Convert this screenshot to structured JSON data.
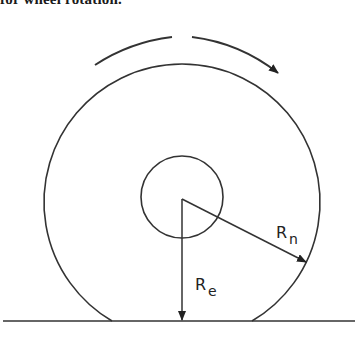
{
  "caption": {
    "text": "for wheel rotation."
  },
  "diagram": {
    "type": "tire-radius-schematic",
    "elements": {
      "outer_tire": {
        "cx": 183,
        "cy": 197,
        "r": 138,
        "flat_contact_left_x": 112,
        "flat_contact_right_x": 252
      },
      "hub": {
        "cx": 182,
        "cy": 197,
        "r": 41
      },
      "ground_line": {
        "y": 321,
        "x1": 3,
        "x2": 355
      },
      "rotation_arrow": {
        "direction": "clockwise"
      }
    },
    "labels": {
      "Rn": {
        "main": "R",
        "sub": "n",
        "meaning": "nominal (unloaded) radius"
      },
      "Re": {
        "main": "R",
        "sub": "e",
        "meaning": "effective (loaded) radius"
      }
    },
    "colors": {
      "stroke": "#333333",
      "background": "#ffffff"
    }
  }
}
